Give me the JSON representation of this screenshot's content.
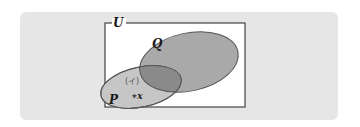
{
  "diagram": {
    "type": "venn",
    "universe_label": "U",
    "sets": [
      {
        "name": "Q",
        "label": "Q",
        "fill": "#a9a9a9",
        "stroke": "#555555"
      },
      {
        "name": "P",
        "label": "P",
        "fill": "#c6c6c6",
        "stroke": "#555555"
      }
    ],
    "intersection_fill": "#8a8a8a",
    "region_label": "(イ)",
    "element_label": "∗x",
    "colors": {
      "background_panel": "#e6e6e6",
      "universe_box": "#ffffff",
      "universe_border": "#444444"
    }
  }
}
